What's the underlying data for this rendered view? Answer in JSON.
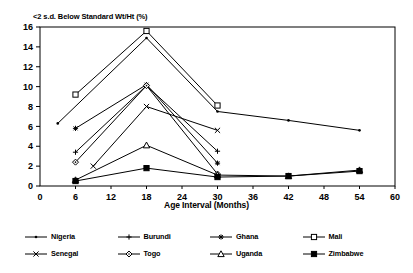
{
  "chart_data": {
    "type": "line",
    "title": "<2 s.d. Below Standard Wt/Ht (%)",
    "xlabel": "Age Interval (Months)",
    "ylabel": "",
    "xlim": [
      0,
      60
    ],
    "ylim": [
      0,
      16
    ],
    "xticks": [
      0,
      6,
      12,
      18,
      24,
      30,
      36,
      42,
      48,
      54,
      60
    ],
    "yticks": [
      0,
      2,
      4,
      6,
      8,
      10,
      12,
      14,
      16
    ],
    "grid": false,
    "legend_position": "bottom",
    "series": [
      {
        "name": "Nigeria",
        "marker": "dot",
        "points": [
          [
            3,
            6.3
          ],
          [
            18,
            14.9
          ],
          [
            30,
            7.5
          ],
          [
            42,
            6.6
          ],
          [
            54,
            5.6
          ]
        ]
      },
      {
        "name": "Burundi",
        "marker": "plus",
        "points": [
          [
            6,
            3.4
          ],
          [
            18,
            10.1
          ],
          [
            30,
            3.5
          ]
        ]
      },
      {
        "name": "Ghana",
        "marker": "star",
        "points": [
          [
            6,
            5.8
          ],
          [
            18,
            10.2
          ],
          [
            30,
            2.3
          ]
        ]
      },
      {
        "name": "Mali",
        "marker": "square-open",
        "points": [
          [
            6,
            9.2
          ],
          [
            18,
            15.6
          ],
          [
            30,
            8.1
          ]
        ]
      },
      {
        "name": "Senegal",
        "marker": "cross",
        "points": [
          [
            9,
            2.0
          ],
          [
            18,
            8.0
          ],
          [
            30,
            5.6
          ]
        ]
      },
      {
        "name": "Togo",
        "marker": "diamond-open",
        "points": [
          [
            6,
            2.4
          ],
          [
            18,
            10.1
          ],
          [
            30,
            1.2
          ]
        ]
      },
      {
        "name": "Uganda",
        "marker": "triangle-open",
        "points": [
          [
            6,
            0.6
          ],
          [
            18,
            4.1
          ],
          [
            30,
            1.1
          ],
          [
            42,
            1.0
          ],
          [
            54,
            1.6
          ]
        ]
      },
      {
        "name": "Zimbabwe",
        "marker": "square-filled",
        "points": [
          [
            6,
            0.5
          ],
          [
            18,
            1.8
          ],
          [
            30,
            0.9
          ],
          [
            42,
            1.0
          ],
          [
            54,
            1.5
          ]
        ]
      }
    ],
    "colors": {
      "line": "#000000",
      "axis": "#000000",
      "background": "#ffffff"
    }
  },
  "legend": {
    "entries": [
      {
        "label": "Nigeria",
        "marker": "dot"
      },
      {
        "label": "Burundi",
        "marker": "plus"
      },
      {
        "label": "Ghana",
        "marker": "star"
      },
      {
        "label": "Mali",
        "marker": "square-open"
      },
      {
        "label": "Senegal",
        "marker": "cross"
      },
      {
        "label": "Togo",
        "marker": "diamond-open"
      },
      {
        "label": "Uganda",
        "marker": "triangle-open"
      },
      {
        "label": "Zimbabwe",
        "marker": "square-filled"
      }
    ]
  }
}
